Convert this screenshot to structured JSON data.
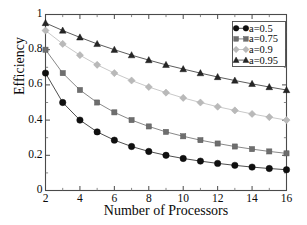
{
  "chart_data": {
    "type": "line",
    "title": "",
    "xlabel": "Number of Processors",
    "ylabel": "Efficiency",
    "xlim": [
      2,
      16
    ],
    "ylim": [
      0,
      1
    ],
    "grid": false,
    "legend_position": "top-right",
    "xticks": [
      "2",
      "4",
      "6",
      "8",
      "10",
      "12",
      "14",
      "16"
    ],
    "xtick_values": [
      2,
      4,
      6,
      8,
      10,
      12,
      14,
      16
    ],
    "yticks": [
      "0",
      "0.2",
      "0.4",
      "0.6",
      "0.8",
      "1"
    ],
    "ytick_values": [
      0,
      0.2,
      0.4,
      0.6,
      0.8,
      1
    ],
    "x": [
      2,
      3,
      4,
      5,
      6,
      7,
      8,
      9,
      10,
      11,
      12,
      13,
      14,
      15,
      16
    ],
    "series": [
      {
        "name": "a=0.5",
        "marker": "circle",
        "color": "#101010",
        "line_color": "#3a3a3a",
        "values": [
          0.667,
          0.5,
          0.4,
          0.333,
          0.286,
          0.25,
          0.222,
          0.2,
          0.182,
          0.167,
          0.154,
          0.143,
          0.133,
          0.125,
          0.118
        ]
      },
      {
        "name": "a=0.75",
        "marker": "square",
        "color": "#6e6e6e",
        "line_color": "#7a7a7a",
        "values": [
          0.8,
          0.667,
          0.571,
          0.5,
          0.444,
          0.4,
          0.364,
          0.333,
          0.308,
          0.286,
          0.267,
          0.25,
          0.235,
          0.222,
          0.211
        ]
      },
      {
        "name": "a=0.9",
        "marker": "diamond",
        "color": "#b9b9b9",
        "line_color": "#c2c2c2",
        "values": [
          0.909,
          0.833,
          0.769,
          0.714,
          0.667,
          0.625,
          0.588,
          0.556,
          0.526,
          0.5,
          0.476,
          0.455,
          0.435,
          0.417,
          0.4
        ]
      },
      {
        "name": "a=0.95",
        "marker": "triangle",
        "color": "#262626",
        "line_color": "#4a4a4a",
        "values": [
          0.952,
          0.909,
          0.87,
          0.833,
          0.8,
          0.769,
          0.741,
          0.714,
          0.69,
          0.667,
          0.645,
          0.625,
          0.606,
          0.588,
          0.571
        ]
      }
    ]
  },
  "legend": {
    "entries": [
      "a=0.5",
      "a=0.75",
      "a=0.9",
      "a=0.95"
    ]
  },
  "axes": {
    "x_title": "Number of Processors",
    "y_title": "Efficiency"
  }
}
